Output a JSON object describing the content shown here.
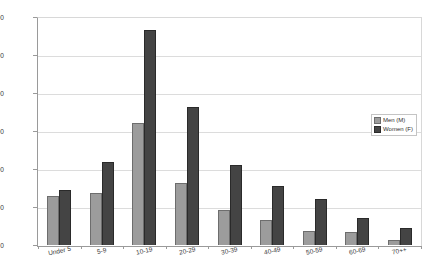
{
  "chart_data": {
    "type": "bar",
    "title": "",
    "xlabel": "",
    "ylabel": "",
    "ylim": [
      0,
      600
    ],
    "ytick_values": [
      600,
      500,
      400,
      300,
      200,
      100,
      0
    ],
    "ytick_labels": [
      "600",
      "500",
      "400",
      "300",
      "200",
      "100",
      "0"
    ],
    "grid": true,
    "legend_position": "right-middle",
    "categories": [
      "Under 5",
      "5-9",
      "10-19",
      "20-29",
      "30-39",
      "40-49",
      "50-59",
      "60-69",
      "70++"
    ],
    "series": [
      {
        "name": "Men (M)",
        "color": "#9c9c9c",
        "values": [
          130,
          138,
          320,
          163,
          93,
          67,
          36,
          33,
          13
        ]
      },
      {
        "name": "Women (F)",
        "color": "#444444",
        "values": [
          144,
          219,
          566,
          362,
          211,
          154,
          121,
          70,
          45
        ]
      }
    ]
  },
  "legend": {
    "items": [
      {
        "label": "Men (M)",
        "swatch": "men"
      },
      {
        "label": "Women (F)",
        "swatch": "women"
      }
    ]
  }
}
